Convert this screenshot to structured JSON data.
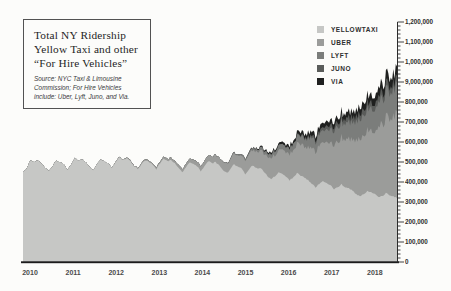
{
  "title": {
    "lines": [
      "Total NY Ridership",
      "Yellow Taxi and other",
      "“For Hire Vehicles”"
    ],
    "source_lines": [
      "Source: NYC Taxi & Limousine",
      "Commission; For Hire Vehicles",
      "include: Uber, Lyft, Juno, and Via."
    ]
  },
  "legend": {
    "position": "top-right",
    "items": [
      {
        "label": "YELLOWTAXI",
        "color": "#c6c7c5"
      },
      {
        "label": "UBER",
        "color": "#9b9c9a"
      },
      {
        "label": "LYFT",
        "color": "#7b7d7b"
      },
      {
        "label": "JUNO",
        "color": "#5a5c5a"
      },
      {
        "label": "VIA",
        "color": "#1f201f"
      }
    ]
  },
  "y_axis": {
    "side": "right",
    "tick_labels": [
      "0",
      "100,000",
      "200,000",
      "300,000",
      "400,000",
      "500,000",
      "600,000",
      "700,000",
      "800,000",
      "9,000,000",
      "1,000,000",
      "1,100,000",
      "1,200,000"
    ],
    "minor_ticks_per_major": 5,
    "axis_color": "#2c2c2c"
  },
  "chart_data": {
    "type": "area",
    "stacked": true,
    "xlabel": "",
    "ylabel": "",
    "unit_note": "series values approximate daily trips, in thousands (axis shows absolute counts)",
    "x_start": "2010-01",
    "x_end": "2018-06",
    "points_per_series": 102,
    "x_tick_labels": [
      "2010",
      "2011",
      "2012",
      "2013",
      "2014",
      "2015",
      "2016",
      "2017",
      "2018"
    ],
    "ylim": [
      0,
      1200000
    ],
    "grid": false,
    "legend_position": "top-right",
    "series": [
      {
        "name": "YELLOWTAXI",
        "color": "#c6c7c5",
        "values_thousands": [
          450,
          470,
          510,
          500,
          510,
          495,
          470,
          455,
          480,
          510,
          500,
          490,
          460,
          490,
          520,
          505,
          515,
          500,
          475,
          460,
          490,
          515,
          505,
          495,
          470,
          500,
          525,
          510,
          520,
          505,
          480,
          465,
          490,
          510,
          500,
          490,
          465,
          495,
          520,
          505,
          510,
          495,
          470,
          450,
          475,
          500,
          490,
          480,
          455,
          480,
          505,
          495,
          500,
          485,
          460,
          445,
          465,
          490,
          480,
          470,
          440,
          460,
          485,
          470,
          470,
          455,
          430,
          415,
          430,
          450,
          440,
          430,
          410,
          425,
          445,
          430,
          425,
          410,
          390,
          375,
          390,
          405,
          395,
          385,
          365,
          375,
          390,
          375,
          370,
          360,
          340,
          330,
          340,
          355,
          350,
          345,
          325,
          330,
          345,
          335,
          330,
          320
        ]
      },
      {
        "name": "UBER",
        "color": "#9b9c9a",
        "values_thousands": [
          0,
          0,
          0,
          0,
          0,
          0,
          0,
          0,
          0,
          0,
          0,
          0,
          0,
          0,
          0,
          0,
          0,
          0,
          0,
          0,
          0,
          0,
          0,
          0,
          1,
          1,
          2,
          2,
          3,
          3,
          4,
          4,
          5,
          6,
          6,
          7,
          8,
          9,
          10,
          11,
          12,
          13,
          14,
          15,
          17,
          19,
          21,
          23,
          25,
          27,
          30,
          33,
          36,
          39,
          42,
          46,
          50,
          55,
          60,
          65,
          70,
          74,
          79,
          84,
          89,
          94,
          99,
          104,
          110,
          116,
          122,
          128,
          135,
          141,
          148,
          155,
          162,
          169,
          176,
          183,
          191,
          199,
          207,
          215,
          224,
          233,
          242,
          251,
          260,
          270,
          280,
          290,
          300,
          311,
          322,
          334,
          350,
          366,
          382,
          398,
          415,
          432
        ]
      },
      {
        "name": "LYFT",
        "color": "#7b7d7b",
        "values_thousands": [
          0,
          0,
          0,
          0,
          0,
          0,
          0,
          0,
          0,
          0,
          0,
          0,
          0,
          0,
          0,
          0,
          0,
          0,
          0,
          0,
          0,
          0,
          0,
          0,
          0,
          0,
          0,
          0,
          0,
          0,
          0,
          0,
          0,
          0,
          0,
          0,
          0,
          0,
          0,
          0,
          0,
          0,
          0,
          0,
          0,
          0,
          0,
          0,
          0,
          0,
          0,
          0,
          0,
          0,
          2,
          3,
          4,
          5,
          6,
          7,
          8,
          9,
          10,
          12,
          14,
          16,
          18,
          20,
          22,
          24,
          26,
          28,
          31,
          34,
          37,
          40,
          43,
          46,
          49,
          52,
          56,
          60,
          64,
          68,
          72,
          76,
          80,
          84,
          88,
          92,
          96,
          100,
          105,
          110,
          115,
          120,
          124,
          128,
          132,
          136,
          140,
          144
        ]
      },
      {
        "name": "JUNO",
        "color": "#5a5c5a",
        "values_thousands": [
          0,
          0,
          0,
          0,
          0,
          0,
          0,
          0,
          0,
          0,
          0,
          0,
          0,
          0,
          0,
          0,
          0,
          0,
          0,
          0,
          0,
          0,
          0,
          0,
          0,
          0,
          0,
          0,
          0,
          0,
          0,
          0,
          0,
          0,
          0,
          0,
          0,
          0,
          0,
          0,
          0,
          0,
          0,
          0,
          0,
          0,
          0,
          0,
          0,
          0,
          0,
          0,
          0,
          0,
          0,
          0,
          0,
          0,
          0,
          0,
          0,
          0,
          0,
          0,
          0,
          0,
          0,
          0,
          0,
          0,
          0,
          0,
          0,
          0,
          3,
          5,
          7,
          9,
          11,
          12,
          14,
          16,
          18,
          20,
          21,
          22,
          23,
          24,
          25,
          26,
          27,
          28,
          29,
          30,
          30,
          31,
          31,
          32,
          32,
          33,
          33,
          34
        ]
      },
      {
        "name": "VIA",
        "color": "#1f201f",
        "values_thousands": [
          0,
          0,
          0,
          0,
          0,
          0,
          0,
          0,
          0,
          0,
          0,
          0,
          0,
          0,
          0,
          0,
          0,
          0,
          0,
          0,
          0,
          0,
          0,
          0,
          0,
          0,
          0,
          0,
          0,
          0,
          0,
          0,
          0,
          0,
          0,
          0,
          0,
          0,
          0,
          0,
          0,
          0,
          0,
          0,
          0,
          0,
          0,
          0,
          0,
          0,
          0,
          0,
          0,
          0,
          0,
          0,
          0,
          0,
          0,
          0,
          2,
          3,
          4,
          5,
          6,
          7,
          8,
          9,
          10,
          11,
          12,
          13,
          14,
          15,
          16,
          17,
          18,
          19,
          20,
          21,
          22,
          23,
          24,
          25,
          26,
          27,
          28,
          29,
          30,
          31,
          32,
          34,
          36,
          38,
          40,
          42,
          43,
          44,
          45,
          46,
          47,
          48
        ]
      }
    ]
  }
}
